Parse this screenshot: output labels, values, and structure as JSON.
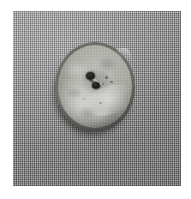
{
  "image": {
    "kind": "photograph",
    "description": "Grayscale photograph of a single two-hole button resting on woven fabric",
    "width_px": 191,
    "height_px": 199,
    "color_mode": "grayscale",
    "margin_color": "#ffffff",
    "photo_area": {
      "x": 13,
      "y": 11,
      "width": 168,
      "height": 175
    }
  },
  "background": {
    "name": "woven fabric",
    "material": "textile weave",
    "base_color": "#8d8d8d",
    "highlight_color": "#b4b4b4",
    "shadow_color": "#6a6a6a",
    "weave_pitch_px": 2
  },
  "subject": {
    "name": "button",
    "type": "two-hole sew-through button",
    "material": "shell / mother-of-pearl",
    "shape": "circular disc",
    "hole_count": 2,
    "center": {
      "x": 95,
      "y": 87
    },
    "diameter_px": 80,
    "rim_color": "#2b2b29",
    "face_light_color": "#bdbdb8",
    "face_mid_color": "#a9a9a3",
    "face_dark_color": "#6f6f6a",
    "hole_color": "#121210",
    "shadow_color": "#3a3a36",
    "features": [
      {
        "name": "hole-upper-left",
        "x": 90,
        "y": 76,
        "diameter_px": 9
      },
      {
        "name": "hole-lower-right",
        "x": 96,
        "y": 86,
        "diameter_px": 8
      },
      {
        "name": "thread-groove",
        "orientation": "diagonal, upper-left to lower-right"
      },
      {
        "name": "rim-chip",
        "position": "upper-right edge"
      },
      {
        "name": "surface-mottling",
        "position": "across face"
      }
    ]
  }
}
